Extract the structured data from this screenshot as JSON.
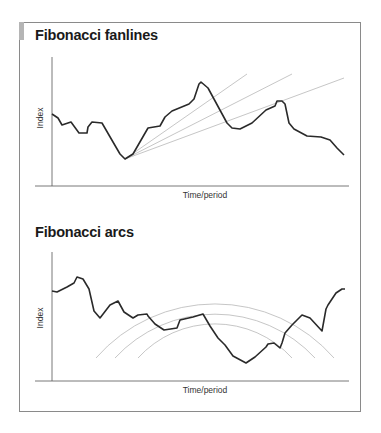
{
  "chart_data": [
    {
      "type": "line",
      "title": "Fibonacci fanlines",
      "xlabel": "Time/period",
      "ylabel": "Index",
      "grid": false,
      "legend": null,
      "series": [
        {
          "name": "Index",
          "points": [
            [
              52,
              114
            ],
            [
              58,
              118
            ],
            [
              62,
              125
            ],
            [
              71,
              122
            ],
            [
              79,
              133
            ],
            [
              87,
              133
            ],
            [
              88,
              127
            ],
            [
              92,
              122
            ],
            [
              102,
              123
            ],
            [
              113,
              142
            ],
            [
              120,
              154
            ],
            [
              125,
              159
            ],
            [
              133,
              154
            ],
            [
              148,
              128
            ],
            [
              160,
              126
            ],
            [
              165,
              117
            ],
            [
              172,
              111
            ],
            [
              189,
              104
            ],
            [
              194,
              99
            ],
            [
              199,
              84
            ],
            [
              201,
              82
            ],
            [
              208,
              88
            ],
            [
              227,
              123
            ],
            [
              232,
              128
            ],
            [
              240,
              129
            ],
            [
              252,
              123
            ],
            [
              266,
              110
            ],
            [
              275,
              106
            ],
            [
              277,
              101
            ],
            [
              282,
              101
            ],
            [
              285,
              104
            ],
            [
              289,
              123
            ],
            [
              294,
              129
            ],
            [
              307,
              136
            ],
            [
              321,
              137
            ],
            [
              330,
              140
            ],
            [
              337,
              148
            ],
            [
              344,
              155
            ]
          ]
        }
      ],
      "annotations": {
        "fanlines": {
          "origin": [
            125,
            159
          ],
          "ends": [
            [
              247,
              74
            ],
            [
              292,
              74
            ],
            [
              344,
              78
            ]
          ]
        }
      }
    },
    {
      "type": "line",
      "title": "Fibonacci arcs",
      "xlabel": "Time/period",
      "ylabel": "Index",
      "grid": false,
      "legend": null,
      "series": [
        {
          "name": "Index",
          "points": [
            [
              52,
              291
            ],
            [
              57,
              292
            ],
            [
              67,
              287
            ],
            [
              74,
              283
            ],
            [
              77,
              277
            ],
            [
              83,
              279
            ],
            [
              89,
              289
            ],
            [
              94,
              311
            ],
            [
              100,
              318
            ],
            [
              110,
              305
            ],
            [
              118,
              301
            ],
            [
              124,
              312
            ],
            [
              133,
              318
            ],
            [
              138,
              315
            ],
            [
              147,
              314
            ],
            [
              148,
              316
            ],
            [
              155,
              324
            ],
            [
              164,
              330
            ],
            [
              177,
              328
            ],
            [
              180,
              320
            ],
            [
              193,
              317
            ],
            [
              203,
              314
            ],
            [
              210,
              326
            ],
            [
              218,
              338
            ],
            [
              225,
              345
            ],
            [
              233,
              356
            ],
            [
              246,
              363
            ],
            [
              255,
              357
            ],
            [
              266,
              347
            ],
            [
              268,
              344
            ],
            [
              274,
              343
            ],
            [
              280,
              348
            ],
            [
              282,
              343
            ],
            [
              285,
              333
            ],
            [
              292,
              325
            ],
            [
              302,
              315
            ],
            [
              310,
              318
            ],
            [
              322,
              331
            ],
            [
              326,
              309
            ],
            [
              328,
              305
            ],
            [
              336,
              293
            ],
            [
              342,
              289
            ],
            [
              345,
              289
            ]
          ]
        }
      ],
      "annotations": {
        "arcs": [
          {
            "center": [
              215,
              462
            ],
            "radius": 158,
            "from": [
              96,
              358
            ],
            "to": [
              334,
              358
            ]
          },
          {
            "center": [
              215,
              450
            ],
            "radius": 136,
            "from": [
              115,
              358
            ],
            "to": [
              315,
              358
            ]
          },
          {
            "center": [
              215,
              428
            ],
            "radius": 104,
            "from": [
              138,
              358
            ],
            "to": [
              292,
              358
            ]
          }
        ]
      }
    }
  ],
  "panels": {
    "fanlines": {
      "title": "Fibonacci fanlines",
      "xlabel": "Time/period",
      "ylabel": "Index"
    },
    "arcs": {
      "title": "Fibonacci arcs",
      "xlabel": "Time/period",
      "ylabel": "Index"
    }
  },
  "colors": {
    "line": "#2a2a2a",
    "guide": "#b8b8b8",
    "axis": "#555555",
    "frame": "#8a8a8a"
  }
}
